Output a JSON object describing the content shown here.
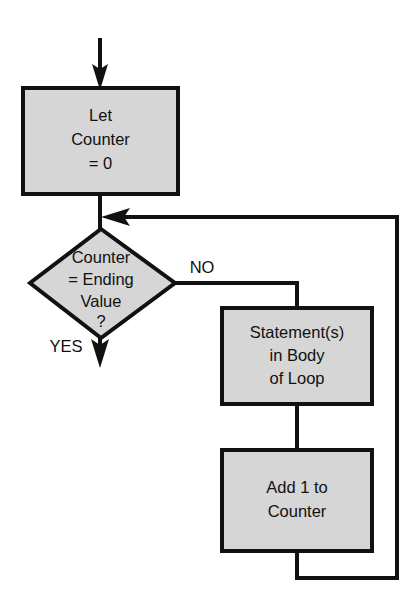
{
  "diagram": {
    "colors": {
      "shape_fill": "#d6d6d6",
      "stroke": "#111111",
      "background": "#ffffff",
      "text": "#111111"
    },
    "nodes": {
      "let_counter": {
        "shape": "process",
        "lines": [
          "Let",
          "Counter",
          "= 0"
        ]
      },
      "decision": {
        "shape": "decision",
        "lines": [
          "Counter",
          "= Ending",
          "Value",
          "?"
        ]
      },
      "body": {
        "shape": "process",
        "lines": [
          "Statement(s)",
          "in Body",
          "of Loop"
        ]
      },
      "increment": {
        "shape": "process",
        "lines": [
          "Add 1 to",
          "Counter"
        ]
      }
    },
    "edge_labels": {
      "no": "NO",
      "yes": "YES"
    }
  }
}
